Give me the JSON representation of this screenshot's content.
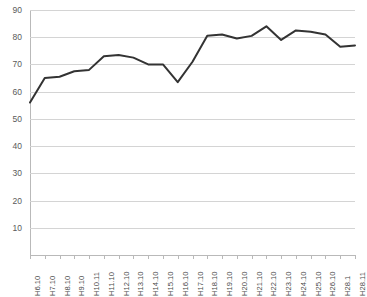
{
  "title_sliver": "",
  "chart_data": {
    "type": "line",
    "title": "",
    "subtitle": "",
    "xlabel": "",
    "ylabel": "",
    "ylim": [
      0,
      90
    ],
    "ytick_step": 10,
    "yticks": [
      90,
      80,
      70,
      60,
      50,
      40,
      30,
      20,
      10
    ],
    "grid": true,
    "legend": "none",
    "categories": [
      "H6.10",
      "H7.10",
      "H8.10",
      "H9.10",
      "H10.11",
      "H11.10",
      "H12.10",
      "H13.10",
      "H14.10",
      "H15.10",
      "H16.10",
      "H17.10",
      "H18.10",
      "H19.10",
      "H20.10",
      "H21.10",
      "H22.10",
      "H23.10",
      "H24.10",
      "H25.10",
      "H26.10",
      "H28.1",
      "H28.11"
    ],
    "series": [
      {
        "name": "series-1",
        "color": "#333333",
        "values": [
          56,
          65,
          65.5,
          67.5,
          68,
          73,
          73.5,
          72.5,
          70,
          70,
          63.5,
          71,
          80.5,
          81,
          79.5,
          80.5,
          84,
          79,
          82.5,
          82,
          81,
          76.5,
          77
        ]
      }
    ]
  }
}
